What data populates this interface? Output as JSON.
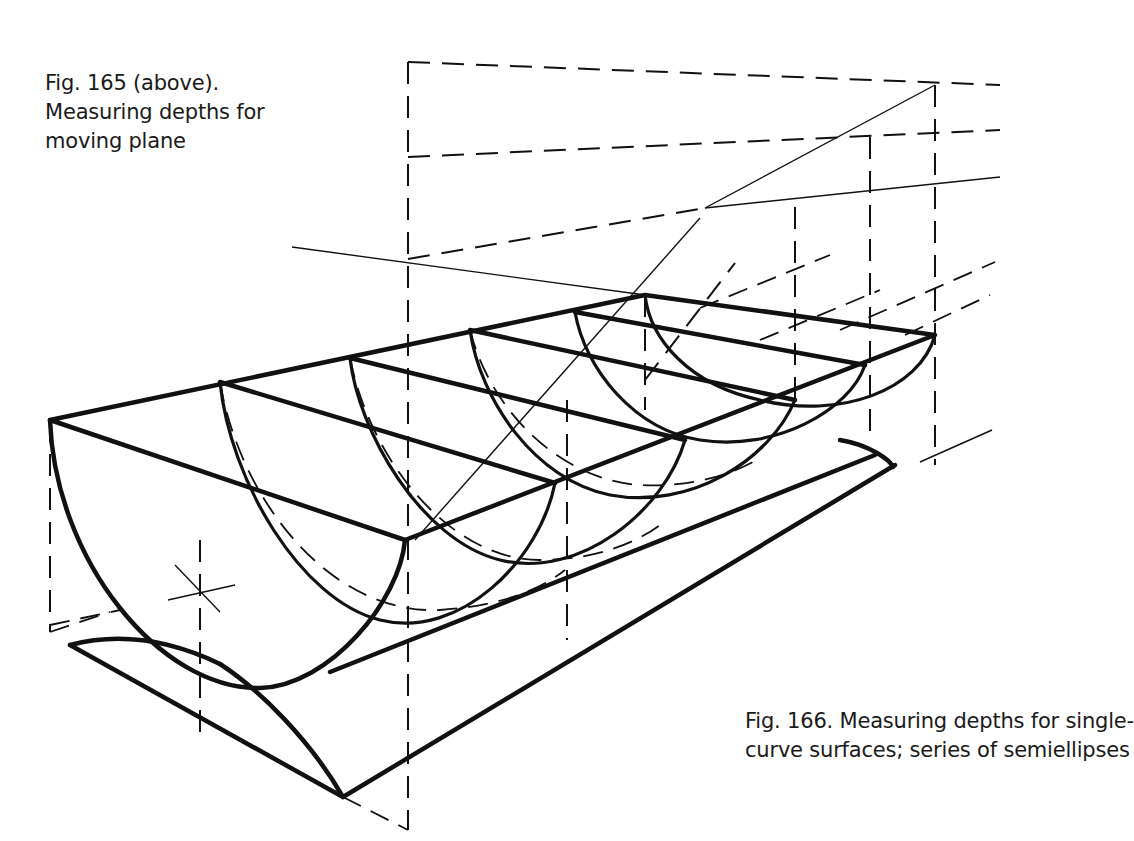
{
  "figure_165": {
    "caption_lines": [
      "Fig. 165 (above).",
      "Measuring depths for",
      "moving plane"
    ]
  },
  "figure_166": {
    "caption_lines": [
      "Fig. 166. Measuring depths for single-",
      "curve surfaces; series of semiellipses"
    ]
  },
  "drawing": {
    "subject": "perspective-trough-of-semiellipses",
    "stroke_color": "#111111",
    "background_color": "#ffffff"
  }
}
